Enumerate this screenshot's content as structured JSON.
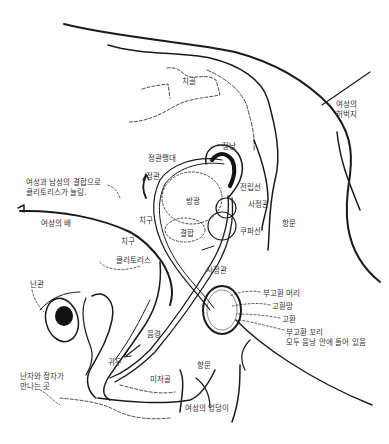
{
  "diagram": {
    "title": "",
    "colors": {
      "line": "#1a1a1a",
      "fill": "#111111",
      "text": "#333333",
      "background": "#ffffff"
    },
    "labels": [
      {
        "id": "pubic-bone",
        "text": "치골",
        "x": 182,
        "y": 77
      },
      {
        "id": "female-thigh",
        "text": "여성의\n허벅지",
        "x": 336,
        "y": 100
      },
      {
        "id": "seminal-vesicle",
        "text": "정낭",
        "x": 222,
        "y": 142
      },
      {
        "id": "ampulla",
        "text": "정관팽대",
        "x": 148,
        "y": 154
      },
      {
        "id": "vas-deferens",
        "text": "정관",
        "x": 146,
        "y": 172
      },
      {
        "id": "note-clitoris",
        "text": "여성과 남성의 결합으로\n클리토리스가 눌림.",
        "x": 26,
        "y": 178
      },
      {
        "id": "prostate",
        "text": "전립선",
        "x": 240,
        "y": 183
      },
      {
        "id": "bladder",
        "text": "방광",
        "x": 186,
        "y": 197
      },
      {
        "id": "ejaculatory-duct",
        "text": "사정관",
        "x": 248,
        "y": 200
      },
      {
        "id": "female-belly",
        "text": "여성의 배",
        "x": 41,
        "y": 219
      },
      {
        "id": "anus-male",
        "text": "항문",
        "x": 282,
        "y": 219
      },
      {
        "id": "pubic-hair-male",
        "text": "치구",
        "x": 139,
        "y": 216
      },
      {
        "id": "union",
        "text": "결합",
        "x": 180,
        "y": 229
      },
      {
        "id": "cowper-gland",
        "text": "쿠퍼선",
        "x": 240,
        "y": 227
      },
      {
        "id": "pubic-hair-female",
        "text": "치구",
        "x": 121,
        "y": 237
      },
      {
        "id": "clitoris",
        "text": "클리토리스",
        "x": 116,
        "y": 256
      },
      {
        "id": "ejaculatory-duct-2",
        "text": "사정관",
        "x": 206,
        "y": 266
      },
      {
        "id": "fallopian-tube",
        "text": "난관",
        "x": 30,
        "y": 280
      },
      {
        "id": "epididymis-head",
        "text": "부고환 머리",
        "x": 263,
        "y": 289
      },
      {
        "id": "seminiferous-tubules",
        "text": "고환망",
        "x": 272,
        "y": 302
      },
      {
        "id": "testis",
        "text": "고환",
        "x": 282,
        "y": 315
      },
      {
        "id": "epididymis-tail",
        "text": "부고환 꼬리",
        "x": 286,
        "y": 328
      },
      {
        "id": "scrotum-note",
        "text": "모두 음낭 안에 들어 있음",
        "x": 286,
        "y": 338
      },
      {
        "id": "penis",
        "text": "음경",
        "x": 147,
        "y": 330
      },
      {
        "id": "glans",
        "text": "귀두",
        "x": 108,
        "y": 358
      },
      {
        "id": "anus-female",
        "text": "항문",
        "x": 197,
        "y": 361
      },
      {
        "id": "tailbone",
        "text": "미저골",
        "x": 150,
        "y": 375
      },
      {
        "id": "fertilization-site",
        "text": "난자와 정자가\n만나는 곳",
        "x": 20,
        "y": 372
      },
      {
        "id": "female-buttocks",
        "text": "여성의 엉덩이",
        "x": 185,
        "y": 404
      }
    ]
  }
}
